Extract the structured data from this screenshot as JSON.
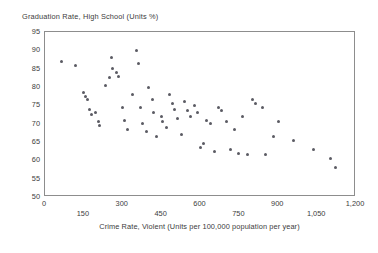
{
  "chart_data": {
    "type": "scatter",
    "title": "Graduation Rate, High School (Units %)",
    "xlabel": "Crime Rate, Violent (Units per 100,000 population per year)",
    "ylabel": "Graduation Rate, High School (Units %)",
    "xlim": [
      0,
      1200
    ],
    "ylim": [
      50,
      95
    ],
    "grid": false,
    "legend": null,
    "x_ticks": [
      0,
      150,
      300,
      450,
      600,
      750,
      900,
      1050,
      1200
    ],
    "x_tick_labels": [
      "0",
      "150",
      "300",
      "450",
      "600",
      "750",
      "900",
      "1,050",
      "1,200"
    ],
    "x_tick_rows": [
      "top",
      "bottom",
      "top",
      "bottom",
      "top",
      "bottom",
      "top",
      "bottom",
      "top"
    ],
    "y_ticks": [
      50,
      55,
      60,
      65,
      70,
      75,
      80,
      85,
      90,
      95
    ],
    "y_tick_labels": [
      "50",
      "55",
      "60",
      "65",
      "70",
      "75",
      "80",
      "85",
      "90",
      "95"
    ],
    "marker_color": "#5b5b63",
    "frame_color": "#8d8d8d",
    "points": [
      {
        "x": 65,
        "y": 87.0
      },
      {
        "x": 118,
        "y": 86.0
      },
      {
        "x": 150,
        "y": 78.5
      },
      {
        "x": 158,
        "y": 77.5
      },
      {
        "x": 163,
        "y": 76.5
      },
      {
        "x": 170,
        "y": 74.0
      },
      {
        "x": 178,
        "y": 72.5
      },
      {
        "x": 196,
        "y": 73.0
      },
      {
        "x": 205,
        "y": 70.5
      },
      {
        "x": 212,
        "y": 69.5
      },
      {
        "x": 232,
        "y": 80.5
      },
      {
        "x": 248,
        "y": 82.5
      },
      {
        "x": 256,
        "y": 88.0
      },
      {
        "x": 262,
        "y": 85.0
      },
      {
        "x": 276,
        "y": 84.0
      },
      {
        "x": 283,
        "y": 83.0
      },
      {
        "x": 300,
        "y": 74.5
      },
      {
        "x": 306,
        "y": 71.0
      },
      {
        "x": 318,
        "y": 68.5
      },
      {
        "x": 336,
        "y": 78.0
      },
      {
        "x": 352,
        "y": 90.0
      },
      {
        "x": 360,
        "y": 86.5
      },
      {
        "x": 368,
        "y": 74.5
      },
      {
        "x": 376,
        "y": 70.0
      },
      {
        "x": 392,
        "y": 68.0
      },
      {
        "x": 400,
        "y": 80.0
      },
      {
        "x": 414,
        "y": 76.5
      },
      {
        "x": 420,
        "y": 73.0
      },
      {
        "x": 430,
        "y": 66.5
      },
      {
        "x": 448,
        "y": 72.0
      },
      {
        "x": 455,
        "y": 70.5
      },
      {
        "x": 468,
        "y": 69.0
      },
      {
        "x": 480,
        "y": 78.0
      },
      {
        "x": 492,
        "y": 75.5
      },
      {
        "x": 500,
        "y": 74.0
      },
      {
        "x": 512,
        "y": 71.5
      },
      {
        "x": 525,
        "y": 67.0
      },
      {
        "x": 540,
        "y": 76.0
      },
      {
        "x": 548,
        "y": 73.5
      },
      {
        "x": 560,
        "y": 72.0
      },
      {
        "x": 575,
        "y": 75.0
      },
      {
        "x": 590,
        "y": 73.0
      },
      {
        "x": 600,
        "y": 63.5
      },
      {
        "x": 612,
        "y": 64.5
      },
      {
        "x": 625,
        "y": 71.0
      },
      {
        "x": 640,
        "y": 70.0
      },
      {
        "x": 655,
        "y": 62.5
      },
      {
        "x": 668,
        "y": 74.5
      },
      {
        "x": 680,
        "y": 73.5
      },
      {
        "x": 700,
        "y": 70.5
      },
      {
        "x": 715,
        "y": 63.0
      },
      {
        "x": 730,
        "y": 68.5
      },
      {
        "x": 745,
        "y": 62.0
      },
      {
        "x": 762,
        "y": 72.0
      },
      {
        "x": 780,
        "y": 61.5
      },
      {
        "x": 800,
        "y": 76.5
      },
      {
        "x": 812,
        "y": 75.5
      },
      {
        "x": 838,
        "y": 74.5
      },
      {
        "x": 850,
        "y": 61.5
      },
      {
        "x": 880,
        "y": 66.5
      },
      {
        "x": 900,
        "y": 70.5
      },
      {
        "x": 960,
        "y": 65.5
      },
      {
        "x": 1035,
        "y": 63.0
      },
      {
        "x": 1100,
        "y": 60.5
      },
      {
        "x": 1120,
        "y": 58.0
      }
    ]
  }
}
